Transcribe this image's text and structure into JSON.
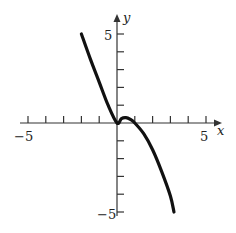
{
  "chart_data": {
    "type": "line",
    "title": "",
    "xlabel": "x",
    "ylabel": "y",
    "xlim": [
      -5,
      5
    ],
    "ylim": [
      -5,
      5
    ],
    "grid": false,
    "x_tick_labels": [
      "-5",
      "5"
    ],
    "y_tick_labels": [
      "5",
      "-5"
    ],
    "tick_spacing": 1,
    "series": [
      {
        "name": "f(x)",
        "x": [
          -2.0,
          -1.5,
          -1.0,
          -0.5,
          0.0,
          0.25,
          0.5,
          0.75,
          1.0,
          1.5,
          2.0,
          2.5,
          3.0,
          3.2
        ],
        "y": [
          5.0,
          3.6,
          2.3,
          1.0,
          0.0,
          0.25,
          0.3,
          0.2,
          0.0,
          -0.6,
          -1.5,
          -2.7,
          -4.1,
          -5.0
        ]
      }
    ]
  },
  "labels": {
    "x_axis": "x",
    "y_axis": "y",
    "x_min": "−5",
    "x_max": "5",
    "y_max": "5",
    "y_min": "−5"
  }
}
